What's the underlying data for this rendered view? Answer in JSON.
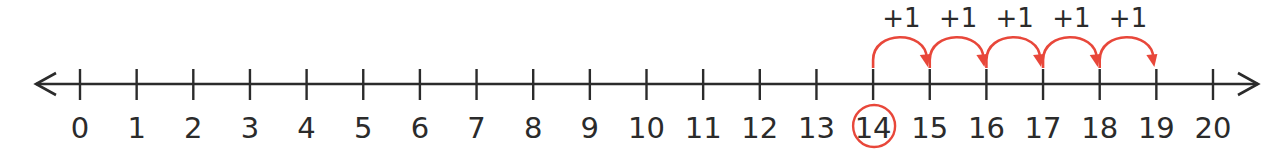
{
  "diagram": {
    "type": "number-line",
    "min": 0,
    "max": 20,
    "ticks": [
      "0",
      "1",
      "2",
      "3",
      "4",
      "5",
      "6",
      "7",
      "8",
      "9",
      "10",
      "11",
      "12",
      "13",
      "14",
      "15",
      "16",
      "17",
      "18",
      "19",
      "20"
    ],
    "start_value": 14,
    "circled_label": "14",
    "jumps": [
      {
        "from": 14,
        "to": 15,
        "label": "+1"
      },
      {
        "from": 15,
        "to": 16,
        "label": "+1"
      },
      {
        "from": 16,
        "to": 17,
        "label": "+1"
      },
      {
        "from": 17,
        "to": 18,
        "label": "+1"
      },
      {
        "from": 18,
        "to": 19,
        "label": "+1"
      }
    ],
    "end_value": 19,
    "colors": {
      "line": "#2b2b2b",
      "accent": "#e8473a"
    }
  }
}
